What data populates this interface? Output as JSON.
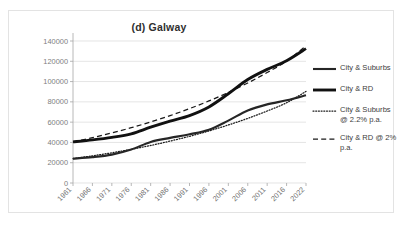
{
  "chart_data": {
    "type": "line",
    "title": "(d) Galway",
    "xlabel": "",
    "ylabel": "",
    "grid": true,
    "legend_position": "right",
    "ylim": [
      0,
      140000
    ],
    "ytick_labels": [
      "140000",
      "120000",
      "100000",
      "80000",
      "60000",
      "40000",
      "20000",
      "0"
    ],
    "yticks": [
      140000,
      120000,
      100000,
      80000,
      60000,
      40000,
      20000,
      0
    ],
    "categories": [
      "1961",
      "1966",
      "1971",
      "1976",
      "1981",
      "1986",
      "1991",
      "1996",
      "2001",
      "2006",
      "2011",
      "2016",
      "2022"
    ],
    "series": [
      {
        "name": "City & Suburbs",
        "style": "solid-thin",
        "values": [
          24000,
          25500,
          28000,
          33000,
          40500,
          44500,
          48000,
          52500,
          61500,
          71500,
          77500,
          81500,
          86500
        ]
      },
      {
        "name": "City & RD",
        "style": "solid-thick",
        "values": [
          40500,
          42500,
          45000,
          48500,
          55000,
          61000,
          66500,
          75000,
          88000,
          102000,
          112000,
          120500,
          132500
        ]
      },
      {
        "name": "City & Suburbs @ 2.2% p.a.",
        "style": "dotted",
        "values": [
          24000,
          26800,
          29800,
          33200,
          37000,
          41300,
          46000,
          51300,
          57200,
          63700,
          71000,
          79100,
          90300
        ]
      },
      {
        "name": "City & RD @ 2% p.a.",
        "style": "dashed",
        "values": [
          40500,
          44700,
          49400,
          54500,
          60200,
          66400,
          73300,
          80900,
          89300,
          98600,
          108900,
          120200,
          135300
        ]
      }
    ]
  },
  "legend": {
    "items": [
      {
        "label": "City & Suburbs",
        "style": "solid-thin"
      },
      {
        "label": "City & RD",
        "style": "solid-thick"
      },
      {
        "label": "City & Suburbs @ 2.2% p.a.",
        "style": "dotted"
      },
      {
        "label": "City & RD @ 2% p.a.",
        "style": "dashed"
      }
    ]
  },
  "colors": {
    "series_dark": "#111111",
    "grid": "#d9d9d9",
    "axis": "#a6a6a6",
    "text": "#3f3f3f",
    "background": "#ffffff",
    "border": "#e3e3e3"
  }
}
